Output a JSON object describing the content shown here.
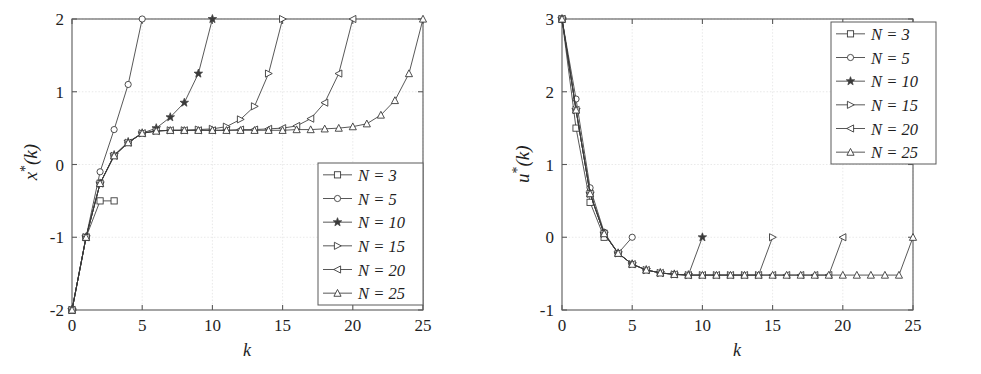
{
  "figure": {
    "background": "#ffffff",
    "axis_color": "#5a5a5a",
    "grid_color": "#e3e3e3",
    "line_color": "#3a3a3a",
    "text_color": "#1f1f1f",
    "width": 981,
    "height": 374
  },
  "series_style": [
    {
      "name": "N = 3",
      "marker": "square",
      "filled": false
    },
    {
      "name": "N = 5",
      "marker": "circle",
      "filled": false
    },
    {
      "name": "N = 10",
      "marker": "star",
      "filled": true
    },
    {
      "name": "N = 15",
      "marker": "triangle-right",
      "filled": false
    },
    {
      "name": "N = 20",
      "marker": "triangle-left",
      "filled": false
    },
    {
      "name": "N = 25",
      "marker": "triangle-up",
      "filled": false
    }
  ],
  "chart_data": [
    {
      "id": "left",
      "type": "line",
      "title": "",
      "xlabel": "k",
      "ylabel": "x*(k)",
      "ylabel_base": "x",
      "ylabel_star": "*",
      "ylabel_arg": "(k)",
      "xlim": [
        0,
        25
      ],
      "ylim": [
        -2,
        2
      ],
      "xticks": [
        0,
        5,
        10,
        15,
        20,
        25
      ],
      "yticks": [
        -2,
        -1,
        0,
        1,
        2
      ],
      "xticklabels": [
        "0",
        "5",
        "10",
        "15",
        "20",
        "25"
      ],
      "yticklabels": [
        "-2",
        "-1",
        "0",
        "1",
        "2"
      ],
      "grid": true,
      "legend_position": "lower right",
      "series": [
        {
          "name": "N = 3",
          "x": [
            0,
            1,
            2,
            3
          ],
          "values": [
            -2.0,
            -1.0,
            -0.5,
            -0.5
          ]
        },
        {
          "name": "N = 5",
          "x": [
            0,
            1,
            2,
            3,
            4,
            5
          ],
          "values": [
            -2.0,
            -1.0,
            -0.1,
            0.48,
            1.1,
            2.0
          ]
        },
        {
          "name": "N = 10",
          "x": [
            0,
            1,
            2,
            3,
            4,
            5,
            6,
            7,
            8,
            9,
            10
          ],
          "values": [
            -2.0,
            -1.0,
            -0.26,
            0.13,
            0.31,
            0.43,
            0.5,
            0.65,
            0.85,
            1.25,
            2.0
          ]
        },
        {
          "name": "N = 15",
          "x": [
            0,
            1,
            2,
            3,
            4,
            5,
            6,
            7,
            8,
            9,
            10,
            11,
            12,
            13,
            14,
            15
          ],
          "values": [
            -2.0,
            -1.0,
            -0.26,
            0.12,
            0.3,
            0.43,
            0.46,
            0.47,
            0.47,
            0.48,
            0.49,
            0.52,
            0.62,
            0.8,
            1.25,
            2.0
          ]
        },
        {
          "name": "N = 20",
          "x": [
            0,
            1,
            2,
            3,
            4,
            5,
            6,
            7,
            8,
            9,
            10,
            11,
            12,
            13,
            14,
            15,
            16,
            17,
            18,
            19,
            20
          ],
          "values": [
            -2.0,
            -1.0,
            -0.26,
            0.12,
            0.3,
            0.43,
            0.46,
            0.47,
            0.47,
            0.47,
            0.47,
            0.47,
            0.48,
            0.48,
            0.49,
            0.5,
            0.53,
            0.63,
            0.85,
            1.25,
            2.0
          ]
        },
        {
          "name": "N = 25",
          "x": [
            0,
            1,
            2,
            3,
            4,
            5,
            6,
            7,
            8,
            9,
            10,
            11,
            12,
            13,
            14,
            15,
            16,
            17,
            18,
            19,
            20,
            21,
            22,
            23,
            24,
            25
          ],
          "values": [
            -2.0,
            -1.0,
            -0.26,
            0.12,
            0.3,
            0.43,
            0.46,
            0.47,
            0.47,
            0.47,
            0.47,
            0.47,
            0.47,
            0.47,
            0.47,
            0.47,
            0.48,
            0.48,
            0.49,
            0.5,
            0.52,
            0.56,
            0.68,
            0.88,
            1.25,
            2.0
          ]
        }
      ]
    },
    {
      "id": "right",
      "type": "line",
      "title": "",
      "xlabel": "k",
      "ylabel": "u*(k)",
      "ylabel_base": "u",
      "ylabel_star": "*",
      "ylabel_arg": "(k)",
      "xlim": [
        0,
        25
      ],
      "ylim": [
        -1,
        3
      ],
      "xticks": [
        0,
        5,
        10,
        15,
        20,
        25
      ],
      "yticks": [
        -1,
        0,
        1,
        2,
        3
      ],
      "xticklabels": [
        "0",
        "5",
        "10",
        "15",
        "20",
        "25"
      ],
      "yticklabels": [
        "-1",
        "0",
        "1",
        "2",
        "3"
      ],
      "grid": true,
      "legend_position": "upper right",
      "series": [
        {
          "name": "N = 3",
          "x": [
            0,
            1,
            2,
            3
          ],
          "values": [
            3.0,
            1.5,
            0.48,
            0.0
          ]
        },
        {
          "name": "N = 5",
          "x": [
            0,
            1,
            2,
            3,
            4,
            5
          ],
          "values": [
            3.0,
            1.9,
            0.68,
            0.07,
            -0.22,
            0.0
          ]
        },
        {
          "name": "N = 10",
          "x": [
            0,
            1,
            2,
            3,
            4,
            5,
            6,
            7,
            8,
            9,
            10
          ],
          "values": [
            3.0,
            1.75,
            0.6,
            0.05,
            -0.22,
            -0.37,
            -0.45,
            -0.49,
            -0.51,
            -0.52,
            0.0
          ]
        },
        {
          "name": "N = 15",
          "x": [
            0,
            1,
            2,
            3,
            4,
            5,
            6,
            7,
            8,
            9,
            10,
            11,
            12,
            13,
            14,
            15
          ],
          "values": [
            3.0,
            1.75,
            0.6,
            0.05,
            -0.22,
            -0.37,
            -0.45,
            -0.49,
            -0.51,
            -0.52,
            -0.52,
            -0.52,
            -0.52,
            -0.52,
            -0.52,
            0.0
          ]
        },
        {
          "name": "N = 20",
          "x": [
            0,
            1,
            2,
            3,
            4,
            5,
            6,
            7,
            8,
            9,
            10,
            11,
            12,
            13,
            14,
            15,
            16,
            17,
            18,
            19,
            20
          ],
          "values": [
            3.0,
            1.75,
            0.6,
            0.05,
            -0.22,
            -0.37,
            -0.45,
            -0.49,
            -0.51,
            -0.52,
            -0.52,
            -0.52,
            -0.52,
            -0.52,
            -0.52,
            -0.52,
            -0.52,
            -0.52,
            -0.52,
            -0.52,
            0.0
          ]
        },
        {
          "name": "N = 25",
          "x": [
            0,
            1,
            2,
            3,
            4,
            5,
            6,
            7,
            8,
            9,
            10,
            11,
            12,
            13,
            14,
            15,
            16,
            17,
            18,
            19,
            20,
            21,
            22,
            23,
            24,
            25
          ],
          "values": [
            3.0,
            1.75,
            0.6,
            0.05,
            -0.22,
            -0.37,
            -0.45,
            -0.49,
            -0.51,
            -0.52,
            -0.52,
            -0.52,
            -0.52,
            -0.52,
            -0.52,
            -0.52,
            -0.52,
            -0.52,
            -0.52,
            -0.52,
            -0.52,
            -0.52,
            -0.52,
            -0.52,
            -0.52,
            0.0
          ]
        }
      ]
    }
  ],
  "legend": {
    "entries": [
      "N = 3",
      "N = 5",
      "N = 10",
      "N = 15",
      "N = 20",
      "N = 25"
    ]
  }
}
